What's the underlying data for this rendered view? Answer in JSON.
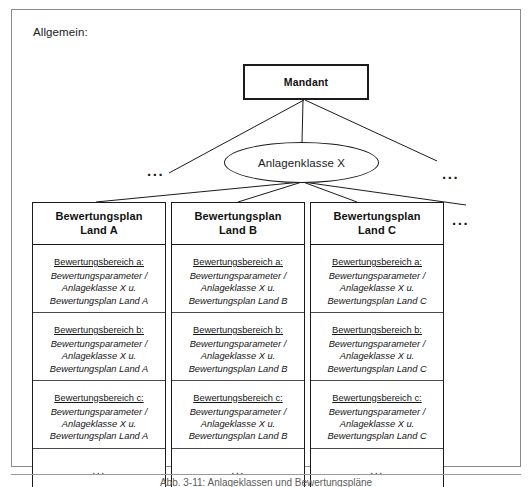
{
  "figure": {
    "section_label": "Allgemein:",
    "caption": "Abb. 3-11: Anlageklassen und Bewertungspläne"
  },
  "root": {
    "label": "Mandant",
    "shape": "rectangle"
  },
  "class_node": {
    "label": "Anlagenklasse X",
    "shape": "ellipse"
  },
  "ellipsis": {
    "left": "...",
    "right": "...",
    "plans": "..."
  },
  "plans": [
    {
      "header_line1": "Bewertungsplan",
      "header_line2": "Land A",
      "areas": [
        {
          "title": "Bewertungsbereich a:",
          "line1": "Bewertungsparameter /",
          "line2": "Anlageklasse X u.",
          "line3": "Bewertungsplan Land A"
        },
        {
          "title": "Bewertungsbereich b:",
          "line1": "Bewertungsparameter /",
          "line2": "Anlageklasse X u.",
          "line3": "Bewertungsplan Land A"
        },
        {
          "title": "Bewertungsbereich c:",
          "line1": "Bewertungsparameter /",
          "line2": "Anlageklasse X u.",
          "line3": "Bewertungsplan Land A"
        }
      ],
      "more": "..."
    },
    {
      "header_line1": "Bewertungsplan",
      "header_line2": "Land B",
      "areas": [
        {
          "title": "Bewertungsbereich a:",
          "line1": "Bewertungsparameter /",
          "line2": "Anlageklasse X u.",
          "line3": "Bewertungsplan Land B"
        },
        {
          "title": "Bewertungsbereich b:",
          "line1": "Bewertungsparameter /",
          "line2": "Anlageklasse X u.",
          "line3": "Bewertungsplan Land B"
        },
        {
          "title": "Bewertungsbereich c:",
          "line1": "Bewertungsparameter /",
          "line2": "Anlageklasse X u.",
          "line3": "Bewertungsplan Land B"
        }
      ],
      "more": "..."
    },
    {
      "header_line1": "Bewertungsplan",
      "header_line2": "Land C",
      "areas": [
        {
          "title": "Bewertungsbereich a:",
          "line1": "Bewertungsparameter /",
          "line2": "Anlageklasse X u.",
          "line3": "Bewertungsplan Land C"
        },
        {
          "title": "Bewertungsbereich b:",
          "line1": "Bewertungsparameter /",
          "line2": "Anlageklasse X u.",
          "line3": "Bewertungsplan Land C"
        },
        {
          "title": "Bewertungsbereich c:",
          "line1": "Bewertungsparameter /",
          "line2": "Anlageklasse X u.",
          "line3": "Bewertungsplan Land C"
        }
      ],
      "more": "..."
    }
  ],
  "colors": {
    "stroke": "#1b1b1b",
    "frame": "#8a8a8a",
    "text": "#151515"
  }
}
